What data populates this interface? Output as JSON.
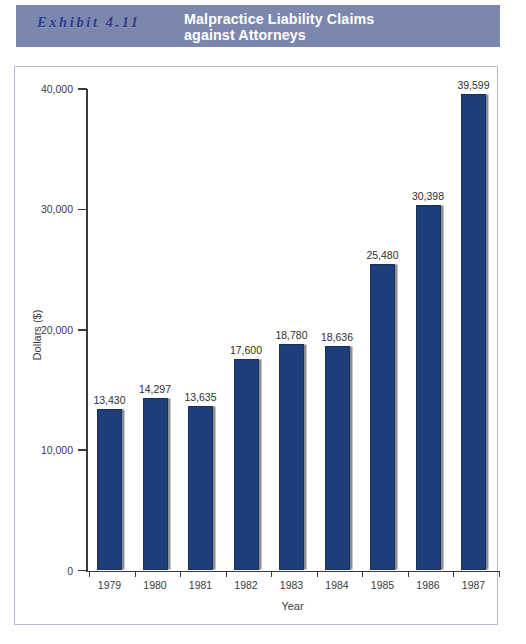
{
  "header": {
    "exhibit_label": "Exhibit 4.11",
    "title": "Malpractice Liability Claims\nagainst Attorneys",
    "band_color": "#7c87ad",
    "label_color": "#2b3a8f",
    "title_color": "#ffffff"
  },
  "chart_data": {
    "type": "bar",
    "title": "Malpractice Liability Claims against Attorneys",
    "xlabel": "Year",
    "ylabel": "Dollars ($)",
    "categories": [
      "1979",
      "1980",
      "1981",
      "1982",
      "1983",
      "1984",
      "1985",
      "1986",
      "1987"
    ],
    "values": [
      13430,
      14297,
      13635,
      17600,
      18780,
      18636,
      25480,
      30398,
      39599
    ],
    "value_labels": [
      "13,430",
      "14,297",
      "13,635",
      "17,600",
      "18,780",
      "18,636",
      "25,480",
      "30,398",
      "39,599"
    ],
    "ylim": [
      0,
      40000
    ],
    "ytick_values": [
      0,
      10000,
      20000,
      30000,
      40000
    ],
    "ytick_labels": [
      "0",
      "10,000",
      "20,000",
      "30,000",
      "40,000"
    ],
    "grid": false,
    "legend": "none",
    "bar_color": "#1e3d7b",
    "bar_shadow_color": "#8e8e8e"
  }
}
